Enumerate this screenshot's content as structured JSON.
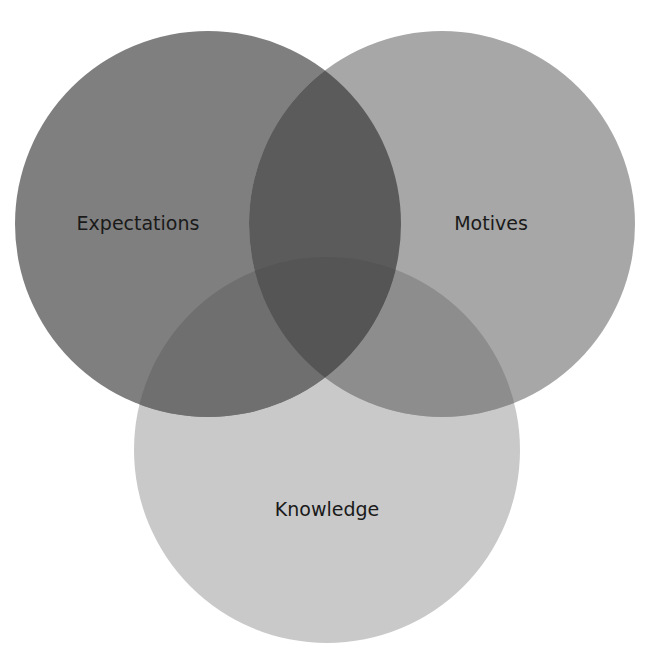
{
  "diagram": {
    "type": "venn",
    "sets": [
      {
        "id": "expectations",
        "label": "Expectations",
        "cx": 208,
        "cy": 224,
        "r": 193,
        "color": "#7f7f7f",
        "label_x": 138,
        "label_y": 230
      },
      {
        "id": "motives",
        "label": "Motives",
        "cx": 442,
        "cy": 224,
        "r": 193,
        "color": "#a7a7a7",
        "label_x": 491,
        "label_y": 230
      },
      {
        "id": "knowledge",
        "label": "Knowledge",
        "cx": 327,
        "cy": 450,
        "r": 193,
        "color": "#c9c9c9",
        "label_x": 327,
        "label_y": 516
      }
    ],
    "overlap_colors": {
      "expectations_motives": "#5b5b5b",
      "expectations_knowledge": "#6f6f6f",
      "motives_knowledge": "#8d8d8d",
      "all": "#555555"
    }
  }
}
